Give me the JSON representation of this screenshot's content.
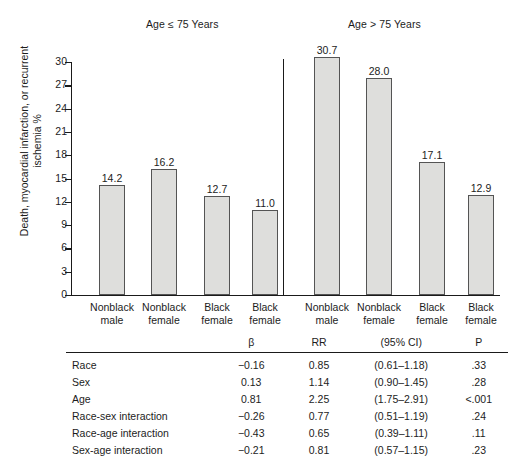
{
  "chart_data": {
    "type": "bar",
    "title": "",
    "xlabel": "",
    "ylabel": "Death, myocardial infarction, or recurrent ischemia %",
    "ylim": [
      0,
      30
    ],
    "yticks": [
      0,
      3,
      6,
      9,
      12,
      15,
      18,
      21,
      24,
      27,
      30
    ],
    "grid": false,
    "legend": "none",
    "panels": [
      {
        "title": "Age ≤ 75 Years",
        "categories": [
          "Nonblack male",
          "Nonblack female",
          "Black female",
          "Black female"
        ],
        "values": [
          14.2,
          16.2,
          12.7,
          11.0
        ],
        "value_labels": [
          "14.2",
          "16.2",
          "12.7",
          "11.0"
        ]
      },
      {
        "title": "Age > 75 Years",
        "categories": [
          "Nonblack male",
          "Nonblack female",
          "Black female",
          "Black female"
        ],
        "values": [
          30.7,
          28.0,
          17.1,
          12.9
        ],
        "value_labels": [
          "30.7",
          "28.0",
          "17.1",
          "12.9"
        ]
      }
    ],
    "category_lines": [
      [
        "Nonblack",
        "male"
      ],
      [
        "Nonblack",
        "female"
      ],
      [
        "Black",
        "female"
      ],
      [
        "Black",
        "female"
      ],
      [
        "Nonblack",
        "male"
      ],
      [
        "Nonblack",
        "female"
      ],
      [
        "Black",
        "female"
      ],
      [
        "Black",
        "female"
      ]
    ],
    "bar_fill": "#dededc",
    "bar_stroke": "#545454",
    "axis_color": "#1a1a1a"
  },
  "table": {
    "headers": [
      "",
      "β",
      "RR",
      "(95% CI)",
      "P"
    ],
    "rows": [
      {
        "label": "Race",
        "beta": "−0.16",
        "rr": "0.85",
        "ci": "(0.61–1.18)",
        "p": ".33"
      },
      {
        "label": "Sex",
        "beta": "0.13",
        "rr": "1.14",
        "ci": "(0.90–1.45)",
        "p": ".28"
      },
      {
        "label": "Age",
        "beta": "0.81",
        "rr": "2.25",
        "ci": "(1.75–2.91)",
        "p": "<.001"
      },
      {
        "label": "Race-sex interaction",
        "beta": "−0.26",
        "rr": "0.77",
        "ci": "(0.51–1.19)",
        "p": ".24"
      },
      {
        "label": "Race-age interaction",
        "beta": "−0.43",
        "rr": "0.65",
        "ci": "(0.39–1.11)",
        "p": ".11"
      },
      {
        "label": "Sex-age interaction",
        "beta": "−0.21",
        "rr": "0.81",
        "ci": "(0.57–1.15)",
        "p": ".23"
      }
    ]
  }
}
